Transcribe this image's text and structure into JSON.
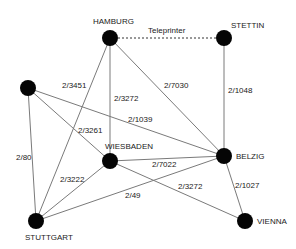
{
  "diagram": {
    "type": "network",
    "nodes": [
      {
        "id": "hamburg",
        "label": "HAMBURG"
      },
      {
        "id": "stettin",
        "label": "STETTIN"
      },
      {
        "id": "left",
        "label": ""
      },
      {
        "id": "wiesbaden",
        "label": "WIESBADEN"
      },
      {
        "id": "belzig",
        "label": "BELZIG"
      },
      {
        "id": "stuttgart",
        "label": "STUTTGART"
      },
      {
        "id": "vienna",
        "label": "VIENNA"
      }
    ],
    "edges": [
      {
        "from": "hamburg",
        "to": "stettin",
        "label": "Teleprinter",
        "style": "dashed"
      },
      {
        "from": "hamburg",
        "to": "stuttgart",
        "label": "2/3451",
        "style": "solid"
      },
      {
        "from": "hamburg",
        "to": "wiesbaden",
        "label": "2/3272",
        "style": "solid"
      },
      {
        "from": "hamburg",
        "to": "belzig",
        "label": "2/7030",
        "style": "solid"
      },
      {
        "from": "stettin",
        "to": "belzig",
        "label": "2/1048",
        "style": "solid"
      },
      {
        "from": "left",
        "to": "stuttgart",
        "label": "2/80",
        "style": "solid"
      },
      {
        "from": "left",
        "to": "wiesbaden",
        "label": "2/3261",
        "style": "solid"
      },
      {
        "from": "left",
        "to": "belzig",
        "label": "2/1039",
        "style": "solid"
      },
      {
        "from": "wiesbaden",
        "to": "stuttgart",
        "label": "2/3222",
        "style": "solid"
      },
      {
        "from": "wiesbaden",
        "to": "belzig",
        "label": "2/7022",
        "style": "solid"
      },
      {
        "from": "wiesbaden",
        "to": "vienna",
        "label": "2/3272",
        "style": "solid"
      },
      {
        "from": "stuttgart",
        "to": "belzig",
        "label": "2/49",
        "style": "solid"
      },
      {
        "from": "belzig",
        "to": "vienna",
        "label": "2/1027",
        "style": "solid"
      }
    ]
  }
}
